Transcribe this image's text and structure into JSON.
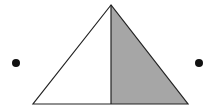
{
  "diagram": {
    "width": 211,
    "height": 111,
    "background": "#ffffff",
    "stroke_color": "#222222",
    "triangle": {
      "apex": [
        111,
        5
      ],
      "base_left": [
        33,
        104
      ],
      "base_right": [
        188,
        104
      ],
      "base_mid": [
        111,
        104
      ],
      "left_half_fill": "#ffffff",
      "right_half_fill": "#a6a6a6"
    },
    "points": [
      {
        "name": "left-point",
        "cx": 16,
        "cy": 63,
        "r": 4,
        "fill": "#111111"
      },
      {
        "name": "right-point",
        "cx": 199,
        "cy": 63,
        "r": 4,
        "fill": "#111111"
      }
    ]
  }
}
